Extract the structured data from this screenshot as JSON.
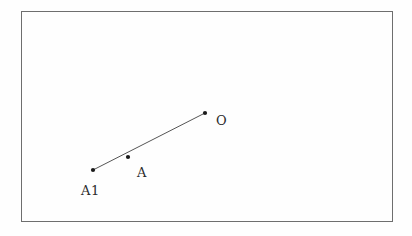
{
  "figure": {
    "type": "geometric-line-diagram",
    "background_color": "#fefefe",
    "frame": {
      "name": "figure-border",
      "x": 21,
      "y": 11,
      "width": 371,
      "height": 210,
      "stroke_color": "#6e6e6e",
      "stroke_width": 1
    },
    "segment": {
      "name": "segment-A1-O",
      "stroke_color": "#555555",
      "stroke_width": 1,
      "from": "A1",
      "through": "A",
      "to": "O"
    },
    "points": [
      {
        "id": "A1",
        "label": "A1",
        "x": 93,
        "y": 170,
        "label_x": 81,
        "label_y": 184,
        "dot_radius": 2.1,
        "dot_color": "#1a1a1a"
      },
      {
        "id": "A",
        "label": "A",
        "x": 128,
        "y": 157,
        "label_x": 137,
        "label_y": 166,
        "dot_radius": 2.1,
        "dot_color": "#1a1a1a"
      },
      {
        "id": "O",
        "label": "O",
        "x": 205,
        "y": 113,
        "label_x": 216,
        "label_y": 114,
        "dot_radius": 2.1,
        "dot_color": "#1a1a1a"
      }
    ],
    "artifacts": [
      {
        "x": 256,
        "y": 38,
        "w": 9,
        "h": 4
      },
      {
        "x": 300,
        "y": 34,
        "w": 14,
        "h": 3
      },
      {
        "x": 311,
        "y": 45,
        "w": 8,
        "h": 7
      },
      {
        "x": 175,
        "y": 30,
        "w": 5,
        "h": 3
      },
      {
        "x": 60,
        "y": 208,
        "w": 7,
        "h": 3
      },
      {
        "x": 340,
        "y": 160,
        "w": 4,
        "h": 9
      },
      {
        "x": 10,
        "y": 228,
        "w": 12,
        "h": 3
      },
      {
        "x": 250,
        "y": 226,
        "w": 30,
        "h": 3
      },
      {
        "x": 130,
        "y": 224,
        "w": 18,
        "h": 2
      }
    ]
  }
}
